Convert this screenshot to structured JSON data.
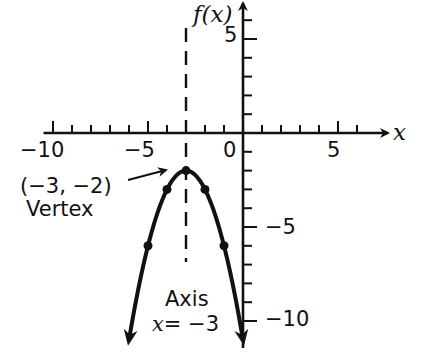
{
  "chart_data": {
    "type": "line",
    "title": "",
    "function": "f(x) = -(x + 3)^2 - 2",
    "xlabel": "x",
    "ylabel": "f(x)",
    "xlim": [
      -10,
      6.5
    ],
    "ylim": [
      -11.5,
      6.5
    ],
    "grid": false,
    "legend": null,
    "x_ticks": [
      -10,
      -9,
      -8,
      -7,
      -6,
      -5,
      -4,
      -3,
      -2,
      -1,
      0,
      1,
      2,
      3,
      4,
      5,
      6
    ],
    "x_tick_labels": [
      {
        "value": -10,
        "label": "−10"
      },
      {
        "value": -5,
        "label": "−5"
      },
      {
        "value": 0,
        "label": "0"
      },
      {
        "value": 5,
        "label": "5"
      }
    ],
    "y_ticks": [
      6,
      5,
      4,
      3,
      2,
      1,
      -1,
      -2,
      -3,
      -4,
      -5,
      -6,
      -7,
      -8,
      -9,
      -10
    ],
    "y_tick_labels": [
      {
        "value": 5,
        "label": "5"
      },
      {
        "value": -5,
        "label": "−5"
      },
      {
        "value": -10,
        "label": "−10"
      }
    ],
    "series": [
      {
        "name": "parabola",
        "points": [
          {
            "x": -5,
            "y": -6
          },
          {
            "x": -4,
            "y": -3
          },
          {
            "x": -3,
            "y": -2
          },
          {
            "x": -2,
            "y": -3
          },
          {
            "x": -1,
            "y": -6
          }
        ],
        "arrows_at_ends": true,
        "curve_extends_to_y": -11
      }
    ],
    "axis_of_symmetry": {
      "x": -3,
      "style": "dashed"
    },
    "annotations": [
      {
        "text": "(−3, −2)",
        "target": {
          "x": -3,
          "y": -2
        },
        "arrow": true
      },
      {
        "text": "Vertex"
      },
      {
        "text": "Axis"
      },
      {
        "text": "x = −3"
      }
    ]
  },
  "labels": {
    "y_axis": "f(x)",
    "x_axis": "x",
    "vertex_coords": "(−3, −2)",
    "vertex_word": "Vertex",
    "axis_word": "Axis",
    "axis_eq_var": "x",
    "axis_eq_rest": "= −3",
    "tick_x_neg10": "−10",
    "tick_x_neg5": "−5",
    "tick_x_0": "0",
    "tick_x_5": "5",
    "tick_y_5": "5",
    "tick_y_neg5": "−5",
    "tick_y_neg10": "−10"
  },
  "colors": {
    "ink": "#111111",
    "background": "#ffffff"
  }
}
